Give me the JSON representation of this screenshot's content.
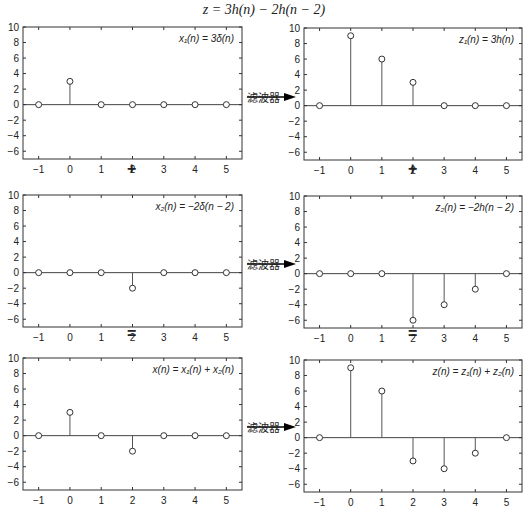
{
  "title": "z = 3h(n) − 2h(n − 2)",
  "operators": {
    "plus_left": "+",
    "plus_right": "+",
    "eq_left": "=",
    "eq_right": "="
  },
  "filter_label": "滤波器",
  "chart_data": [
    {
      "type": "stem",
      "title": "x₁(n) = 3δ(n)",
      "x": [
        -1,
        0,
        1,
        2,
        3,
        4,
        5
      ],
      "values": [
        0,
        3,
        0,
        0,
        0,
        0,
        0
      ],
      "xlim": [
        -1.5,
        5.5
      ],
      "ylim": [
        -7,
        10
      ],
      "yticks": [
        -6,
        -4,
        -2,
        0,
        2,
        4,
        6,
        8,
        10
      ]
    },
    {
      "type": "stem",
      "title": "z₁(n) = 3h(n)",
      "x": [
        -1,
        0,
        1,
        2,
        3,
        4,
        5
      ],
      "values": [
        0,
        9,
        6,
        3,
        0,
        0,
        0
      ],
      "xlim": [
        -1.5,
        5.5
      ],
      "ylim": [
        -7,
        10
      ],
      "yticks": [
        -6,
        -4,
        -2,
        0,
        2,
        4,
        6,
        8,
        10
      ]
    },
    {
      "type": "stem",
      "title": "x₂(n) = −2δ(n − 2)",
      "x": [
        -1,
        0,
        1,
        2,
        3,
        4,
        5
      ],
      "values": [
        0,
        0,
        0,
        -2,
        0,
        0,
        0
      ],
      "xlim": [
        -1.5,
        5.5
      ],
      "ylim": [
        -7,
        10
      ],
      "yticks": [
        -6,
        -4,
        -2,
        0,
        2,
        4,
        6,
        8,
        10
      ]
    },
    {
      "type": "stem",
      "title": "z₂(n) = −2h(n − 2)",
      "x": [
        -1,
        0,
        1,
        2,
        3,
        4,
        5
      ],
      "values": [
        0,
        0,
        0,
        -6,
        -4,
        -2,
        0
      ],
      "xlim": [
        -1.5,
        5.5
      ],
      "ylim": [
        -7,
        10
      ],
      "yticks": [
        -6,
        -4,
        -2,
        0,
        2,
        4,
        6,
        8,
        10
      ]
    },
    {
      "type": "stem",
      "title": "x(n) = x₁(n) + x₂(n)",
      "x": [
        -1,
        0,
        1,
        2,
        3,
        4,
        5
      ],
      "values": [
        0,
        3,
        0,
        -2,
        0,
        0,
        0
      ],
      "xlim": [
        -1.5,
        5.5
      ],
      "ylim": [
        -7,
        10
      ],
      "yticks": [
        -6,
        -4,
        -2,
        0,
        2,
        4,
        6,
        8,
        10
      ]
    },
    {
      "type": "stem",
      "title": "z(n) = z₁(n) + z₂(n)",
      "x": [
        -1,
        0,
        1,
        2,
        3,
        4,
        5
      ],
      "values": [
        0,
        9,
        6,
        -3,
        -4,
        -2,
        0
      ],
      "xlim": [
        -1.5,
        5.5
      ],
      "ylim": [
        -7,
        10
      ],
      "yticks": [
        -6,
        -4,
        -2,
        0,
        2,
        4,
        6,
        8,
        10
      ]
    }
  ]
}
